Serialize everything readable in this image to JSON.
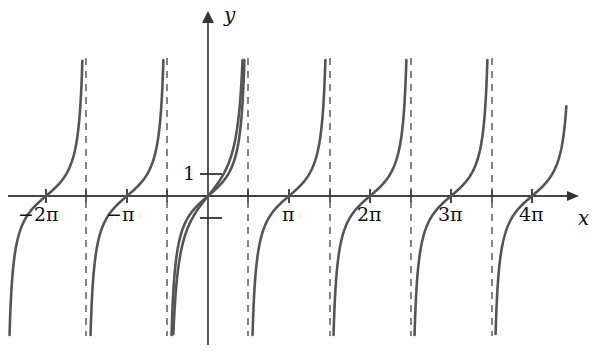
{
  "figure": {
    "title": "",
    "background_color": "#ffffff",
    "curve_color": "#555555",
    "axis_color": "#444444",
    "asymptote_color": "#666666",
    "width": 604,
    "height": 357
  },
  "axes": {
    "x_axis_label": "x",
    "y_axis_label": "y",
    "origin_px": {
      "x": 208,
      "y": 196
    },
    "pi_px": 81,
    "y_unit_px": 22,
    "x_tick_labels": [
      {
        "text": "−2π",
        "value": -6.2832,
        "px": 46
      },
      {
        "text": "−π",
        "value": -3.1416,
        "px": 127
      },
      {
        "text": "π",
        "value": 3.1416,
        "px": 289
      },
      {
        "text": "2π",
        "value": 6.2832,
        "px": 370
      },
      {
        "text": "3π",
        "value": 9.4248,
        "px": 451
      },
      {
        "text": "4π",
        "value": 12.5664,
        "px": 532
      }
    ],
    "x_minor_ticks": [
      -4.7124,
      -1.5708,
      1.5708,
      4.7124,
      7.854,
      10.9956
    ],
    "y_tick_labels": [
      {
        "text": "1",
        "value": 1,
        "px": 174
      }
    ],
    "y_minor_ticks": [
      -1
    ]
  },
  "chart_data": {
    "type": "line",
    "title": "",
    "xlabel": "x",
    "ylabel": "y",
    "xlim": [
      -7.8,
      13.9
    ],
    "ylim": [
      -6.3,
      6.3
    ],
    "grid": false,
    "legend": "none",
    "x_tick_values": [
      -6.2832,
      -3.1416,
      3.1416,
      6.2832,
      9.4248,
      12.5664
    ],
    "x_tick_text": [
      "−2π",
      "−π",
      "π",
      "2π",
      "3π",
      "4π"
    ],
    "y_tick_values": [
      1
    ],
    "y_tick_text": [
      "1"
    ],
    "asymptotes": [
      -4.7124,
      -1.5708,
      1.5708,
      4.7124,
      7.854,
      10.9956
    ],
    "series": [
      {
        "name": "y = tan x",
        "formula": "tan(x)",
        "color": "#555555",
        "style": "solid",
        "branches": [
          {
            "from": -7.8,
            "to": -4.7124
          },
          {
            "from": -4.7124,
            "to": -1.5708
          },
          {
            "from": -1.5708,
            "to": 1.5708
          },
          {
            "from": 1.5708,
            "to": 4.7124
          },
          {
            "from": 4.7124,
            "to": 7.854
          },
          {
            "from": 7.854,
            "to": 10.9956
          },
          {
            "from": 10.9956,
            "to": 13.9
          }
        ]
      },
      {
        "name": "second tangent branch near origin",
        "formula": "1.45*tan(x)",
        "color": "#555555",
        "style": "solid",
        "branches": [
          {
            "from": -1.5708,
            "to": 1.5708
          }
        ]
      }
    ]
  }
}
